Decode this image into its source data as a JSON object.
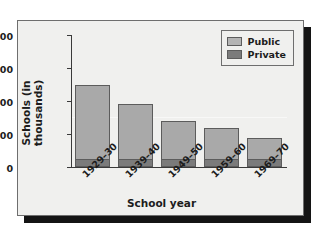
{
  "chart_data": {
    "type": "bar",
    "subtype": "stacked-bar",
    "title": "",
    "xlabel": "School year",
    "ylabel": "Schools (in thousands)",
    "categories": [
      "1929–30",
      "1939–40",
      "1949–50",
      "1959–60",
      "1969–70"
    ],
    "series": [
      {
        "name": "Private",
        "values": [
          25,
          25,
          25,
          25,
          25
        ],
        "color": "#7b7b7b"
      },
      {
        "name": "Public",
        "values": [
          225,
          165,
          115,
          93,
          63
        ],
        "color": "#a9a9a9"
      }
    ],
    "totals": [
      250,
      190,
      140,
      118,
      88
    ],
    "ylim": [
      0,
      400
    ],
    "yticks": [
      "0",
      "100",
      "200",
      "300",
      "400"
    ],
    "ytick_values": [
      0,
      100,
      200,
      300,
      400
    ],
    "grid": false,
    "legend_position": "top-right",
    "legend_entries": [
      "Public",
      "Private"
    ]
  },
  "legend": {
    "public_label": "Public",
    "private_label": "Private"
  },
  "axes": {
    "x_title": "School year",
    "y_title": "Schools (in thousands)"
  }
}
